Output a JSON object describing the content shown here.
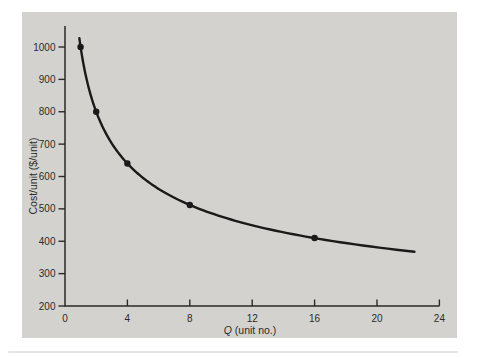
{
  "figure": {
    "background_color": "#ffffff",
    "panel_color": "#d3d2ce",
    "axis_color": "#2a2a2a",
    "curve_color": "#1a1a1a",
    "text_color": "#2b2b2b"
  },
  "chart_data": {
    "type": "line",
    "title": "",
    "xlabel": "Q (unit no.)",
    "xlabel_italic": "Q",
    "xlabel_rest": " (unit no.)",
    "ylabel": "Cost/unit ($/unit)",
    "xlim": [
      0,
      24
    ],
    "ylim": [
      200,
      1000
    ],
    "x_ticks": [
      0,
      4,
      8,
      12,
      16,
      20,
      24
    ],
    "y_ticks": [
      200,
      300,
      400,
      500,
      600,
      700,
      800,
      900,
      1000
    ],
    "grid": false,
    "legend": null,
    "series": [
      {
        "marker": "filled-circle",
        "color": "#1a1a1a",
        "points": [
          {
            "x": 1,
            "y": 1000
          },
          {
            "x": 2,
            "y": 800
          },
          {
            "x": 4,
            "y": 640
          },
          {
            "x": 8,
            "y": 512
          },
          {
            "x": 16,
            "y": 410
          }
        ],
        "curve_fit": {
          "model": "power",
          "coefficient": 1000,
          "exponent": -0.3219,
          "x_start": 0.92,
          "x_end": 22.4
        }
      }
    ]
  }
}
